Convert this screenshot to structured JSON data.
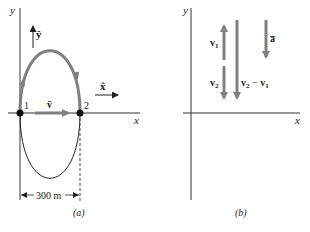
{
  "panel_a": {
    "y_axis_label": "y",
    "x_axis_label": "x",
    "unit_y_label": "ŷ",
    "unit_x_label": "x̂",
    "point1_label": "1",
    "point2_label": "2",
    "avg_velocity_label": "v̄",
    "distance_label": "300 m",
    "caption": "(a)"
  },
  "panel_b": {
    "y_axis_label": "y",
    "x_axis_label": "x",
    "v1_label": "v",
    "v1_sub": "1",
    "v2_label": "v",
    "v2_sub": "2",
    "diff_label_a": "v",
    "diff_sub_a": "2",
    "diff_minus": " − ",
    "diff_label_b": "v",
    "diff_sub_b": "1",
    "accel_label": "a̅",
    "caption": "(b)"
  },
  "colors": {
    "arrow_gray": "#808080",
    "line_black": "#222222"
  }
}
